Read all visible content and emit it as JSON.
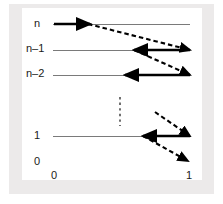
{
  "figure": {
    "kind": "trellis-lattice-diagram",
    "background_color": "#ffffff",
    "mat_color": "#eceaea",
    "panel_color": "#ffffff",
    "line_color": "#7a7a7a",
    "arrow_color": "#000000"
  },
  "y_axis": {
    "labels": [
      {
        "text": "n",
        "x": 34,
        "y": 18
      },
      {
        "text": "n–1",
        "x": 26,
        "y": 43
      },
      {
        "text": "n–2",
        "x": 26,
        "y": 68
      },
      {
        "text": "1",
        "x": 34,
        "y": 130
      },
      {
        "text": "0",
        "x": 34,
        "y": 156
      }
    ]
  },
  "x_axis": {
    "labels": [
      {
        "text": "0",
        "x": 51,
        "y": 170
      },
      {
        "text": "1",
        "x": 186,
        "y": 170
      }
    ]
  },
  "chart_data": {
    "type": "diagram",
    "title": "",
    "xlabel": "",
    "ylabel": "",
    "row_levels": [
      "n",
      "n-1",
      "n-2",
      "1",
      "0"
    ],
    "row_y": [
      24,
      50,
      75,
      136,
      161
    ],
    "x_range": [
      0,
      1
    ],
    "x_pixel_range": [
      53,
      190
    ],
    "grid": false,
    "legend": null,
    "state_lines": [
      {
        "level": "n",
        "y": 24,
        "x1": 53,
        "x2": 190
      },
      {
        "level": "n-1",
        "y": 50,
        "x1": 53,
        "x2": 190
      },
      {
        "level": "n-2",
        "y": 75,
        "x1": 53,
        "x2": 190
      },
      {
        "level": "1",
        "y": 136,
        "x1": 53,
        "x2": 190
      }
    ],
    "vertical_dots": {
      "x": 120,
      "y1": 97,
      "y2": 126
    },
    "arrows": [
      {
        "id": "solid-n-right",
        "style": "solid",
        "x1": 54,
        "y1": 24,
        "x2": 90,
        "y2": 24
      },
      {
        "id": "dashed-n-to-n1",
        "style": "dashed",
        "x1": 88,
        "y1": 24,
        "x2": 190,
        "y2": 50
      },
      {
        "id": "solid-n1-left",
        "style": "solid",
        "x1": 190,
        "y1": 50,
        "x2": 134,
        "y2": 50
      },
      {
        "id": "dashed-n1-to-n2",
        "style": "dashed",
        "x1": 134,
        "y1": 50,
        "x2": 190,
        "y2": 75
      },
      {
        "id": "solid-n2-left",
        "style": "solid",
        "x1": 190,
        "y1": 75,
        "x2": 125,
        "y2": 75
      },
      {
        "id": "dashed-into-1",
        "style": "dashed",
        "x1": 155,
        "y1": 112,
        "x2": 190,
        "y2": 136
      },
      {
        "id": "solid-1-left",
        "style": "solid",
        "x1": 190,
        "y1": 136,
        "x2": 143,
        "y2": 136
      },
      {
        "id": "dashed-1-to-0",
        "style": "dashed",
        "x1": 143,
        "y1": 136,
        "x2": 188,
        "y2": 161
      }
    ]
  }
}
